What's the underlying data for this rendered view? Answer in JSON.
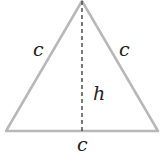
{
  "diagram": {
    "type": "equilateral triangle with altitude",
    "labels": {
      "left_side": "c",
      "right_side": "c",
      "height": "h",
      "base": "c"
    },
    "colors": {
      "edge": "#b8b8b8",
      "altitude": "#333333",
      "text": "#222222"
    }
  }
}
